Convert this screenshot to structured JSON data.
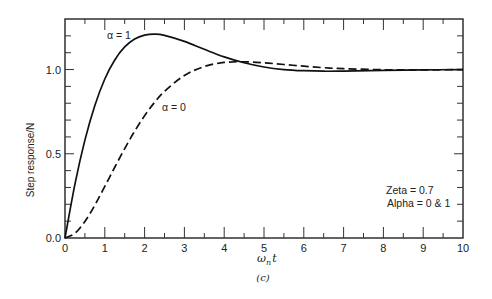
{
  "chart_data": {
    "type": "line",
    "title": "",
    "caption": "(c)",
    "xlabel": "ωₙt",
    "xlabel_main": "ω",
    "xlabel_sub": "n",
    "xlabel_tail": "t",
    "ylabel": "Step response/N",
    "xlim": [
      0,
      10
    ],
    "ylim": [
      0,
      1.3
    ],
    "x_ticks": [
      0,
      1,
      2,
      3,
      4,
      5,
      6,
      7,
      8,
      9,
      10
    ],
    "x_tick_labels": [
      "0",
      "1",
      "2",
      "3",
      "4",
      "5",
      "6",
      "7",
      "8",
      "9",
      "10"
    ],
    "x_minor_step": 0.5,
    "y_ticks": [
      0.0,
      0.5,
      1.0
    ],
    "y_tick_labels": [
      "0.0",
      "0.5",
      "1.0"
    ],
    "y_minor_step": 0.1,
    "grid": false,
    "legend": null,
    "annotations": [
      {
        "text": "α = 1",
        "x": 1.0,
        "y": 1.2,
        "series": "alpha_1"
      },
      {
        "text": "α = 0",
        "x": 2.4,
        "y": 0.79,
        "series": "alpha_0"
      },
      {
        "text": "Zeta = 0.7",
        "x": 8.0,
        "y": 0.3
      },
      {
        "text": "Alpha = 0 & 1",
        "x": 8.0,
        "y": 0.22
      }
    ],
    "x": [
      0,
      0.25,
      0.5,
      0.75,
      1,
      1.25,
      1.5,
      1.75,
      2,
      2.25,
      2.5,
      3,
      3.5,
      4,
      4.5,
      5,
      5.5,
      6,
      6.5,
      7,
      8,
      9,
      10
    ],
    "series": [
      {
        "name": "α = 1",
        "style": "solid",
        "values": [
          0,
          0.32,
          0.581,
          0.787,
          0.944,
          1.057,
          1.134,
          1.181,
          1.204,
          1.21,
          1.203,
          1.167,
          1.12,
          1.075,
          1.04,
          1.015,
          1.0,
          0.993,
          0.99,
          0.991,
          0.995,
          0.998,
          1.0
        ]
      },
      {
        "name": "α = 0",
        "style": "dashed",
        "values": [
          0,
          0.028,
          0.098,
          0.195,
          0.306,
          0.42,
          0.531,
          0.634,
          0.726,
          0.805,
          0.871,
          0.965,
          1.018,
          1.042,
          1.046,
          1.04,
          1.03,
          1.02,
          1.011,
          1.005,
          0.999,
          0.998,
          1.0
        ]
      }
    ]
  },
  "text": {
    "label_alpha1": "α = 1",
    "label_alpha0": "α = 0",
    "zeta": "Zeta = 0.7",
    "alpha": "Alpha = 0 & 1",
    "ylabel": "Step response/N",
    "caption": "(c)"
  }
}
